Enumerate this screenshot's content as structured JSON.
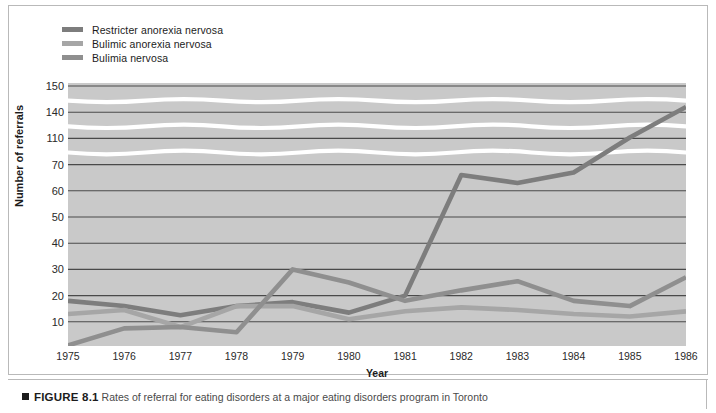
{
  "figure": {
    "marker_icon": "black-square-bullet",
    "number_label": "FIGURE 8.1",
    "caption": "Rates of referral for eating disorders at a major eating disorders program in Toronto"
  },
  "legend": {
    "position": "top-left",
    "items": [
      {
        "label": "Restricter anorexia nervosa",
        "color": "#7d7d7d"
      },
      {
        "label": "Bulimic anorexia nervosa",
        "color": "#a6a6a6"
      },
      {
        "label": "Bulimia nervosa",
        "color": "#8f8f8f"
      }
    ]
  },
  "axes": {
    "ylabel": "Number of referrals",
    "xlabel": "Year",
    "y_ticks": [
      "10",
      "20",
      "30",
      "40",
      "50",
      "60",
      "70",
      "110",
      "140",
      "150"
    ],
    "x_ticks": [
      "1975",
      "1976",
      "1977",
      "1978",
      "1979",
      "1980",
      "1981",
      "1982",
      "1983",
      "1984",
      "1985",
      "1986"
    ],
    "axis_break": true,
    "grid": "horizontal"
  },
  "colors": {
    "plot_background": "#c9c9c9",
    "gridline": "#4a4a4a",
    "axis_break_band": "#ffffff",
    "page_background": "#ffffff",
    "frame_border": "#b9b9b9"
  },
  "chart_data": {
    "type": "line",
    "title": "Rates of referral for eating disorders at a major eating disorders program in Toronto",
    "xlabel": "Year",
    "ylabel": "Number of referrals",
    "grid": true,
    "legend_position": "top-left",
    "axis_break_note": "Y axis is broken/compressed above 70: ticks 10-70 are linear, then 110, 140, 150 are compressed bands separated by white break markers.",
    "ylim": [
      0,
      150
    ],
    "y_ticks": [
      10,
      20,
      30,
      40,
      50,
      60,
      70,
      110,
      140,
      150
    ],
    "categories": [
      1975,
      1976,
      1977,
      1978,
      1979,
      1980,
      1981,
      1982,
      1983,
      1984,
      1985,
      1986
    ],
    "x": [
      1975,
      1976,
      1977,
      1978,
      1979,
      1980,
      1981,
      1982,
      1983,
      1984,
      1985,
      1986
    ],
    "series": [
      {
        "name": "Restricter anorexia nervosa",
        "color": "#7d7d7d",
        "values": [
          18,
          16,
          12.5,
          16,
          17.5,
          13.5,
          20,
          66,
          63,
          67,
          111,
          142
        ]
      },
      {
        "name": "Bulimic anorexia nervosa",
        "color": "#a6a6a6",
        "values": [
          13,
          14.5,
          8,
          16,
          16,
          11,
          14,
          15.5,
          14.5,
          13,
          12,
          14
        ]
      },
      {
        "name": "Bulimia nervosa",
        "color": "#8f8f8f",
        "values": [
          1,
          7.5,
          8,
          6,
          30,
          25,
          18,
          22,
          25.5,
          18,
          16,
          27
        ]
      }
    ]
  }
}
